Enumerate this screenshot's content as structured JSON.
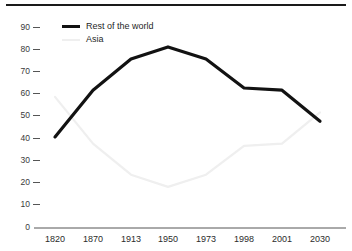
{
  "chart_data": {
    "type": "line",
    "title": "",
    "subtitle": "",
    "xlabel": "",
    "ylabel": "",
    "x": [
      "1820",
      "1870",
      "1913",
      "1950",
      "1973",
      "1998",
      "2001",
      "2030"
    ],
    "categories": [
      "1820",
      "1870",
      "1913",
      "1950",
      "1973",
      "1998",
      "2001",
      "2030"
    ],
    "ylim": [
      0,
      90
    ],
    "yticks": [
      0,
      10,
      20,
      30,
      40,
      50,
      60,
      70,
      80,
      90
    ],
    "ytick_labels": [
      "0",
      "10",
      "20",
      "30",
      "40",
      "50",
      "60",
      "70",
      "80",
      "90"
    ],
    "grid": false,
    "legend_position": "top-left",
    "series": [
      {
        "name": "Rest of the world",
        "color": "#121212",
        "values": [
          41,
          62,
          76,
          81.5,
          76,
          63,
          62,
          48
        ]
      },
      {
        "name": "Asia",
        "color": "#efefef",
        "values": [
          59,
          38,
          24,
          18.5,
          24,
          37,
          38,
          52
        ]
      }
    ],
    "annotations": []
  },
  "legend": {
    "items": [
      {
        "label": "Rest of the world",
        "swatch": "thick-dark-line"
      },
      {
        "label": "Asia",
        "swatch": "thin-light-line"
      }
    ]
  },
  "axes": {
    "y_labels": [
      "90",
      "80",
      "70",
      "60",
      "50",
      "40",
      "30",
      "20",
      "10",
      "0"
    ],
    "x_labels": [
      "1820",
      "1870",
      "1913",
      "1950",
      "1973",
      "1998",
      "2001",
      "2030"
    ]
  },
  "colors": {
    "rest_of_world": "#121212",
    "asia": "#efefef",
    "axis": "#555555",
    "rule": "#1a1a1a"
  }
}
